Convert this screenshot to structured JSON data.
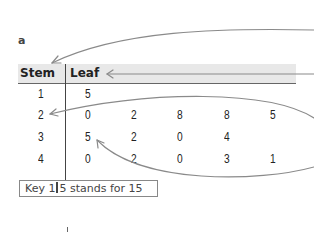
{
  "section_label": "a",
  "table": {
    "headers": {
      "stem": "Stem",
      "leaf": "Leaf"
    },
    "rows": [
      {
        "stem": "1",
        "leaves": [
          "5"
        ]
      },
      {
        "stem": "2",
        "leaves": [
          "0",
          "2",
          "8",
          "8",
          "5"
        ]
      },
      {
        "stem": "3",
        "leaves": [
          "5",
          "2",
          "0",
          "4"
        ]
      },
      {
        "stem": "4",
        "leaves": [
          "0",
          "2",
          "0",
          "3",
          "1"
        ]
      }
    ]
  },
  "key": {
    "prefix": "Key 1",
    "suffix": "5 stands for 15"
  },
  "colors": {
    "header_bg": "#e8e8e8",
    "arrow": "#888888",
    "lines": "#444444"
  }
}
